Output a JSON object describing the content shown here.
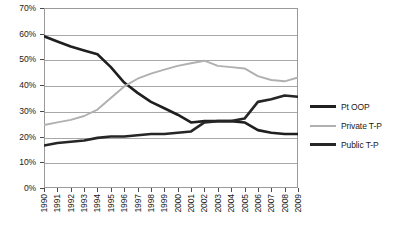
{
  "chart_data": {
    "type": "line",
    "title": "",
    "xlabel": "",
    "ylabel": "",
    "grid": true,
    "legend_position": "right",
    "ylim": [
      0,
      70
    ],
    "ytick_labels": [
      "70%",
      "60%",
      "50%",
      "40%",
      "30%",
      "20%",
      "10%",
      "0%"
    ],
    "ytick_values": [
      70,
      60,
      50,
      40,
      30,
      20,
      10,
      0
    ],
    "x": [
      "1990",
      "1991",
      "1992",
      "1993",
      "1994",
      "1995",
      "1996",
      "1997",
      "1998",
      "1999",
      "2000",
      "2001",
      "2002",
      "2003",
      "2004",
      "2005",
      "2006",
      "2007",
      "2008",
      "2009"
    ],
    "categories": [
      "1990",
      "1991",
      "1992",
      "1993",
      "1994",
      "1995",
      "1996",
      "1997",
      "1998",
      "1999",
      "2000",
      "2001",
      "2002",
      "2003",
      "2004",
      "2005",
      "2006",
      "2007",
      "2008",
      "2009"
    ],
    "series": [
      {
        "name": "Pt OOP",
        "color": "#1f1f1f",
        "values": [
          59.0,
          57.0,
          55.0,
          53.5,
          52.0,
          47.0,
          41.0,
          37.0,
          33.5,
          31.0,
          28.5,
          25.5,
          26.0,
          26.0,
          26.0,
          25.5,
          22.5,
          21.5,
          21.0,
          21.0
        ]
      },
      {
        "name": "Private T-P",
        "color": "#b0b0b0",
        "values": [
          24.5,
          25.5,
          26.5,
          28.0,
          30.5,
          35.0,
          39.5,
          42.5,
          44.5,
          46.0,
          47.5,
          48.5,
          49.5,
          47.5,
          47.0,
          46.5,
          43.5,
          42.0,
          41.5,
          43.0
        ]
      },
      {
        "name": "Public T-P",
        "color": "#262626",
        "values": [
          16.5,
          17.5,
          18.0,
          18.5,
          19.5,
          20.0,
          20.0,
          20.5,
          21.0,
          21.0,
          21.5,
          22.0,
          25.5,
          26.0,
          26.0,
          27.0,
          33.5,
          34.5,
          36.0,
          35.5
        ]
      }
    ]
  },
  "legend": {
    "entries": [
      {
        "label": "Pt OOP"
      },
      {
        "label": "Private T-P"
      },
      {
        "label": "Public T-P"
      }
    ]
  }
}
